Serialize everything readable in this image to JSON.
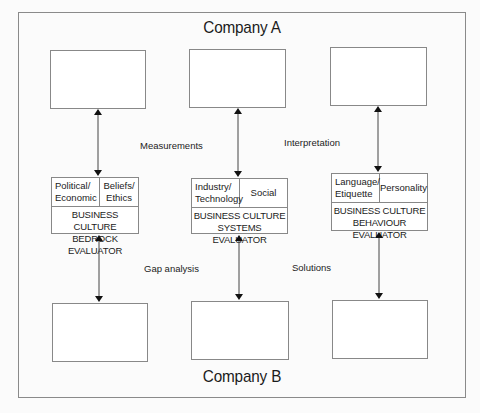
{
  "diagram": {
    "top_label": "Company A",
    "bottom_label": "Company B",
    "flow_labels": {
      "measurements": "Measurements",
      "interpretation": "Interpretation",
      "gap_analysis": "Gap analysis",
      "solutions": "Solutions"
    },
    "evaluators": [
      {
        "cells": [
          "Political/\nEconomic",
          "Beliefs/\nEthics"
        ],
        "cell_left": "Political/ Economic",
        "cell_right": "Beliefs/ Ethics",
        "title_line1": "BUSINESS CULTURE",
        "title_line2": "BEDROCK EVALUATOR"
      },
      {
        "cell_left": "Industry/ Technology",
        "cell_right": "Social",
        "title_line1": "BUSINESS CULTURE",
        "title_line2": "SYSTEMS EVALUATOR"
      },
      {
        "cell_left": "Language/ Etiquette",
        "cell_right": "Personality",
        "title_line1": "BUSINESS CULTURE",
        "title_line2": "BEHAVIOUR EVALUATOR"
      }
    ],
    "colors": {
      "line": "#888888",
      "text": "#1b1b1b",
      "background": "#fbfbfb"
    }
  }
}
